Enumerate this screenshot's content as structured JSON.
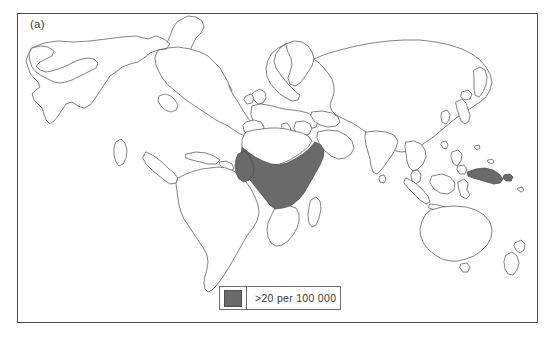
{
  "figure": {
    "panel_label": "(a)",
    "background_color": "#ffffff",
    "frame_color": "#4b4b4b"
  },
  "legend": {
    "entries": [
      {
        "swatch_color": "#6a6a6a",
        "label": ">20 per 100 000"
      }
    ]
  },
  "map": {
    "projection_style": "world-outline",
    "coastline_color": "#5a5a5a",
    "land_fill": "#ffffff",
    "highlight_fill": "#6a6a6a",
    "highlighted_regions": [
      "sub-saharan-africa",
      "papua-new-guinea"
    ],
    "unhighlighted_notable_regions": [
      "north-america",
      "south-america",
      "europe",
      "north-africa",
      "asia",
      "india",
      "southeast-asia",
      "australia",
      "new-zealand",
      "madagascar",
      "southern-africa",
      "greenland"
    ]
  }
}
